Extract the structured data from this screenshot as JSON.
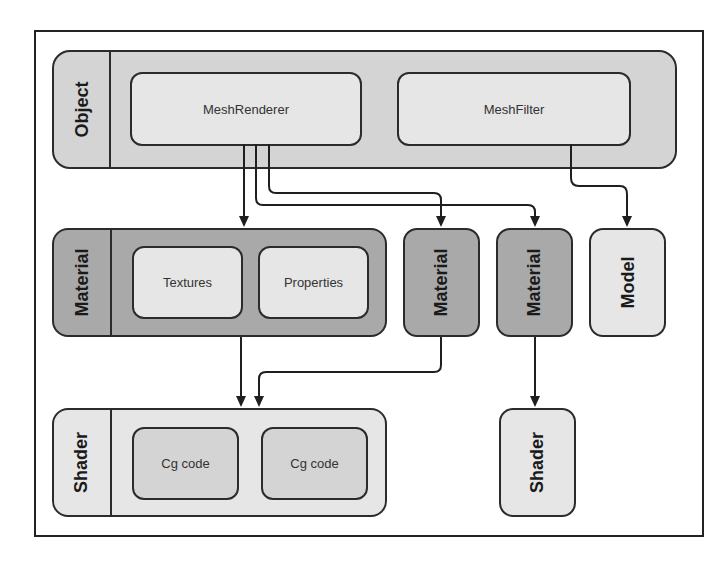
{
  "diagram": {
    "object": {
      "label": "Object",
      "children": [
        "MeshRenderer",
        "MeshFilter"
      ]
    },
    "material_group": {
      "label": "Material",
      "children": [
        "Textures",
        "Properties"
      ]
    },
    "material_2": {
      "label": "Material"
    },
    "material_3": {
      "label": "Material"
    },
    "model": {
      "label": "Model"
    },
    "shader_group": {
      "label": "Shader",
      "children": [
        "Cg code",
        "Cg code"
      ]
    },
    "shader_2": {
      "label": "Shader"
    },
    "edges": [
      {
        "from": "MeshRenderer",
        "to": "Material (group)"
      },
      {
        "from": "MeshRenderer",
        "to": "Material 2"
      },
      {
        "from": "MeshRenderer",
        "to": "Material 3"
      },
      {
        "from": "MeshFilter",
        "to": "Model"
      },
      {
        "from": "Material (group)",
        "to": "Shader (group)"
      },
      {
        "from": "Material 2",
        "to": "Shader (group)"
      },
      {
        "from": "Material 3",
        "to": "Shader 2"
      }
    ]
  },
  "colors": {
    "light_fill": "#e6e6e6",
    "mid_fill": "#d4d4d4",
    "dark_fill": "#a9a9a9",
    "stroke": "#2b2b2b"
  }
}
